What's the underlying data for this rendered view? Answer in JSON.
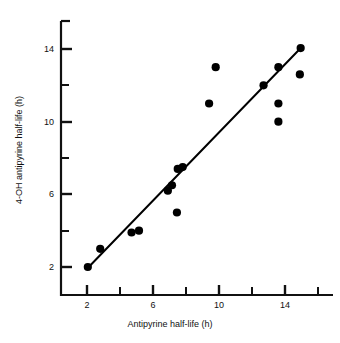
{
  "chart_data": {
    "type": "scatter",
    "title": "",
    "xlabel": "Antipyrine half-life (h)",
    "ylabel": "4-OH antipyrine half-life (h)",
    "xlim": [
      1.0,
      16.6
    ],
    "ylim": [
      0.6,
      15.4
    ],
    "grid": false,
    "legend": null,
    "x_major_ticks": [
      2,
      6,
      10,
      14
    ],
    "x_minor_ticks": [
      4,
      8,
      12,
      16
    ],
    "y_major_ticks": [
      2,
      6,
      10,
      14
    ],
    "y_minor_ticks": [
      4,
      8,
      12
    ],
    "x_tick_labels": [
      "2",
      "6",
      "10",
      "14"
    ],
    "y_tick_labels": [
      "2",
      "6",
      "10",
      "14"
    ],
    "marker": "filled-circle",
    "marker_color": "#000000",
    "marker_size_px": 7,
    "points": [
      {
        "x": 2.05,
        "y": 2.0
      },
      {
        "x": 2.8,
        "y": 3.0
      },
      {
        "x": 4.7,
        "y": 3.9
      },
      {
        "x": 5.15,
        "y": 4.0
      },
      {
        "x": 6.9,
        "y": 6.2
      },
      {
        "x": 7.15,
        "y": 6.5
      },
      {
        "x": 7.5,
        "y": 7.4
      },
      {
        "x": 7.8,
        "y": 7.5
      },
      {
        "x": 7.45,
        "y": 5.0
      },
      {
        "x": 9.4,
        "y": 11.0
      },
      {
        "x": 9.8,
        "y": 13.0
      },
      {
        "x": 12.7,
        "y": 12.0
      },
      {
        "x": 13.6,
        "y": 13.0
      },
      {
        "x": 13.6,
        "y": 11.0
      },
      {
        "x": 13.6,
        "y": 10.0
      },
      {
        "x": 14.9,
        "y": 12.6
      },
      {
        "x": 14.95,
        "y": 14.05
      }
    ],
    "fit_line": {
      "type": "linear-regression",
      "x_start": 2.0,
      "y_start": 1.9,
      "x_end": 15.0,
      "y_end": 14.1,
      "color": "#000000",
      "width_px": 2
    },
    "axis_color": "#111111"
  },
  "axes": {
    "x_tick_labels": [
      "2",
      "6",
      "10",
      "14"
    ],
    "y_tick_labels": [
      "2",
      "6",
      "10",
      "14"
    ],
    "xlabel": "Antipyrine half-life (h)",
    "ylabel": "4-OH antipyrine half-life (h)"
  }
}
